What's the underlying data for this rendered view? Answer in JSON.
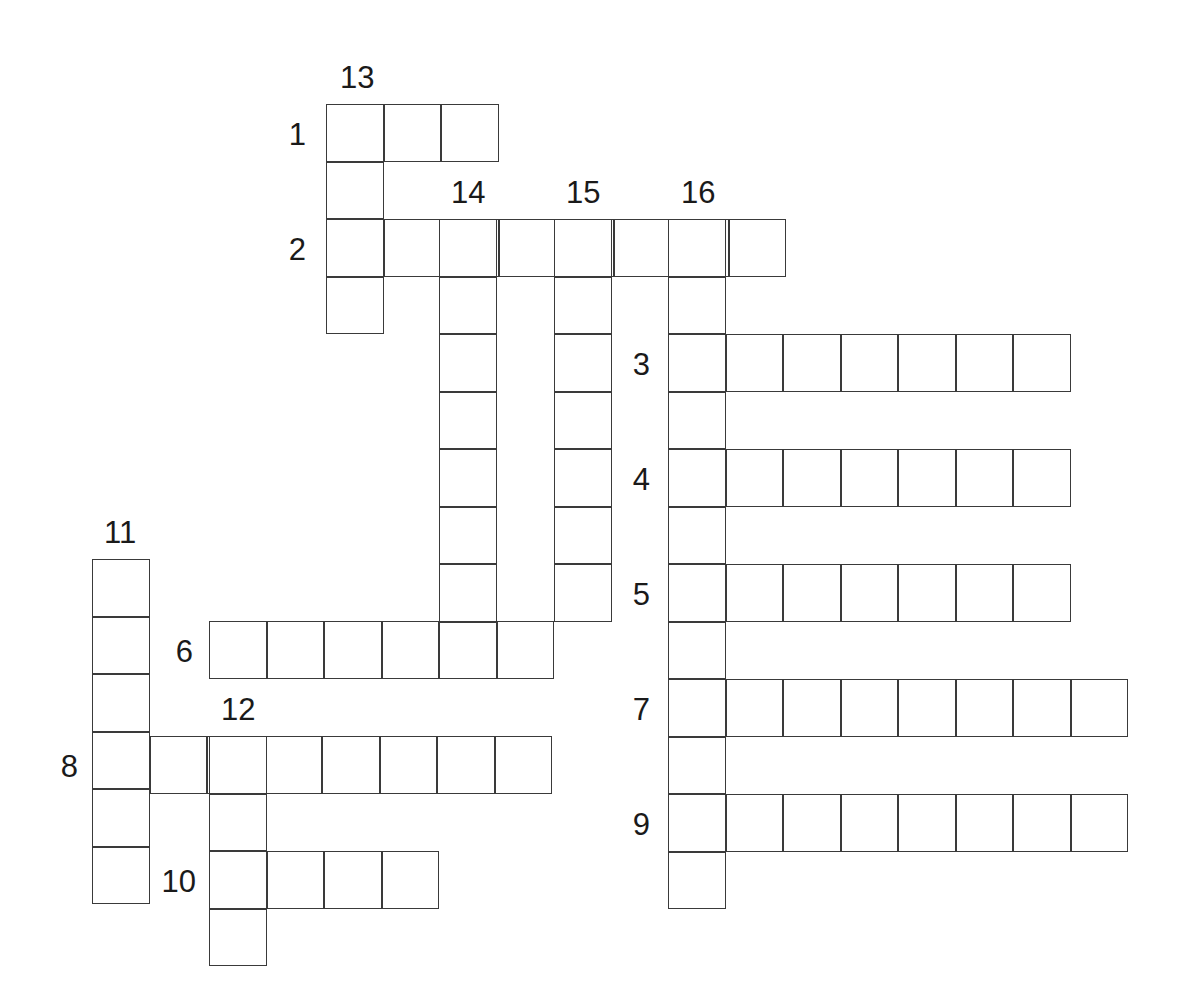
{
  "puzzle": {
    "title": "Crossword Puzzle Grid",
    "cell_size": 57.5,
    "origin_x": 93,
    "origin_y": 105,
    "grid_line_color": "#3a3a3a",
    "cell_fill_color": "#ffffff",
    "background_color": "#ffffff",
    "across_label": "Across",
    "down_label": "Down",
    "entries": [
      {
        "number": "1",
        "direction": "across",
        "length": 3,
        "start_x": 327,
        "start_y": 105,
        "label_x": 306,
        "label_y": 134,
        "label_anchor": "left"
      },
      {
        "number": "2",
        "direction": "across",
        "length": 8,
        "start_x": 327,
        "start_y": 220,
        "label_x": 306,
        "label_y": 249,
        "label_anchor": "left"
      },
      {
        "number": "3",
        "direction": "across",
        "length": 7,
        "start_x": 669,
        "start_y": 335,
        "label_x": 650,
        "label_y": 364,
        "label_anchor": "left"
      },
      {
        "number": "4",
        "direction": "across",
        "length": 7,
        "start_x": 669,
        "start_y": 450,
        "label_x": 650,
        "label_y": 479,
        "label_anchor": "left"
      },
      {
        "number": "5",
        "direction": "across",
        "length": 7,
        "start_x": 669,
        "start_y": 565,
        "label_x": 650,
        "label_y": 594,
        "label_anchor": "left"
      },
      {
        "number": "6",
        "direction": "across",
        "length": 6,
        "start_x": 210,
        "start_y": 622,
        "label_x": 193,
        "label_y": 651,
        "label_anchor": "left"
      },
      {
        "number": "7",
        "direction": "across",
        "length": 8,
        "start_x": 669,
        "start_y": 680,
        "label_x": 650,
        "label_y": 709,
        "label_anchor": "left"
      },
      {
        "number": "8",
        "direction": "across",
        "length": 8,
        "start_x": 93,
        "start_y": 737,
        "label_x": 78,
        "label_y": 766,
        "label_anchor": "left"
      },
      {
        "number": "9",
        "direction": "across",
        "length": 8,
        "start_x": 669,
        "start_y": 795,
        "label_x": 650,
        "label_y": 824,
        "label_anchor": "left"
      },
      {
        "number": "10",
        "direction": "across",
        "length": 4,
        "start_x": 210,
        "start_y": 852,
        "label_x": 196,
        "label_y": 881,
        "label_anchor": "left"
      },
      {
        "number": "11",
        "direction": "down",
        "length": 6,
        "start_x": 93,
        "start_y": 560,
        "label_x": 104,
        "label_y": 548,
        "label_anchor": "top"
      },
      {
        "number": "12",
        "direction": "down",
        "length": 4,
        "start_x": 210,
        "start_y": 737,
        "label_x": 221,
        "label_y": 725,
        "label_anchor": "top"
      },
      {
        "number": "13",
        "direction": "down",
        "length": 4,
        "start_x": 327,
        "start_y": 105,
        "label_x": 340,
        "label_y": 93,
        "label_anchor": "top"
      },
      {
        "number": "14",
        "direction": "down",
        "length": 8,
        "start_x": 440,
        "start_y": 220,
        "label_x": 451,
        "label_y": 208,
        "label_anchor": "top"
      },
      {
        "number": "15",
        "direction": "down",
        "length": 7,
        "start_x": 555,
        "start_y": 220,
        "label_x": 566,
        "label_y": 208,
        "label_anchor": "top"
      },
      {
        "number": "16",
        "direction": "down",
        "length": 12,
        "start_x": 669,
        "start_y": 220,
        "label_x": 681,
        "label_y": 208,
        "label_anchor": "top"
      }
    ]
  }
}
